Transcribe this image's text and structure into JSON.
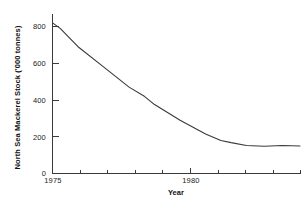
{
  "chart_data": {
    "type": "line",
    "title": "",
    "xlabel": "Year",
    "ylabel": "North Sea Mackerel Stock ('000 tonnes)",
    "xlim": [
      1975,
      1984.7
    ],
    "ylim": [
      0,
      820
    ],
    "grid": false,
    "legend": null,
    "x_ticks": [
      1975,
      1976,
      1977,
      1978,
      1979,
      1980,
      1981,
      1982,
      1983,
      1984
    ],
    "x_tick_labels": [
      "1975",
      "",
      "",
      "",
      "",
      "1980",
      "",
      "",
      "",
      ""
    ],
    "y_ticks": [
      0,
      200,
      400,
      600,
      800
    ],
    "y_tick_labels": [
      "0",
      "200",
      "400",
      "600",
      "800"
    ],
    "line_color": "#3a3a3a",
    "series": [
      {
        "name": "North Sea Mackerel Stock",
        "x": [
          1975.0,
          1975.3,
          1976.0,
          1977.0,
          1978.0,
          1978.6,
          1979.0,
          1980.0,
          1981.0,
          1981.6,
          1982.0,
          1982.6,
          1983.3,
          1984.0,
          1984.7
        ],
        "values": [
          820,
          790,
          690,
          580,
          470,
          420,
          375,
          290,
          215,
          180,
          168,
          152,
          148,
          152,
          150
        ]
      }
    ]
  },
  "axes": {
    "y_axis_title": "North Sea Mackerel Stock ('000 tonnes)",
    "x_axis_title": "Year",
    "y_tick_texts": [
      "800",
      "600",
      "400",
      "200",
      "0"
    ],
    "x_tick_texts": [
      "1975",
      "1980"
    ]
  }
}
